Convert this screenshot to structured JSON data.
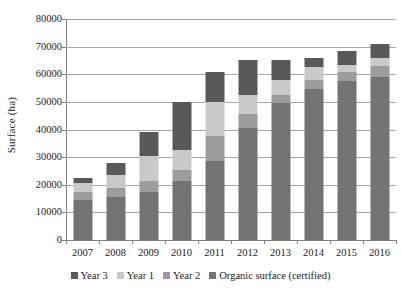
{
  "chart_data": {
    "type": "bar",
    "stacked": true,
    "title": "",
    "xlabel": "",
    "ylabel": "Surface (ha)",
    "ylim": [
      0,
      80000
    ],
    "ytick_labels": [
      "80000",
      "70000",
      "60000",
      "50000",
      "40000",
      "30000",
      "20000",
      "10000",
      "0"
    ],
    "yticks": [
      80000,
      70000,
      60000,
      50000,
      40000,
      30000,
      20000,
      10000,
      0
    ],
    "grid": true,
    "legend_position": "bottom",
    "categories": [
      "2007",
      "2008",
      "2009",
      "2010",
      "2011",
      "2012",
      "2013",
      "2014",
      "2015",
      "2016"
    ],
    "stack_order_bottom_to_top": [
      "Organic surface (certified)",
      "Year 2",
      "Year 1",
      "Year 3"
    ],
    "series": [
      {
        "name": "Organic surface (certified)",
        "color": "#737373",
        "values": [
          14500,
          15500,
          17500,
          21500,
          28500,
          40500,
          49500,
          54500,
          57500,
          59000
        ]
      },
      {
        "name": "Year 2",
        "color": "#9c9c9c",
        "values": [
          3000,
          3500,
          4000,
          4000,
          9000,
          5000,
          3000,
          3500,
          3500,
          4000
        ]
      },
      {
        "name": "Year 1",
        "color": "#c9c9c9",
        "values": [
          3000,
          4500,
          9000,
          7000,
          12500,
          7000,
          5500,
          4500,
          2500,
          3000
        ]
      },
      {
        "name": "Year 3",
        "color": "#595959",
        "values": [
          2000,
          4500,
          8500,
          17500,
          11000,
          12500,
          7000,
          3500,
          5000,
          5000
        ]
      }
    ],
    "totals": [
      22500,
      28000,
      39000,
      50000,
      61000,
      65000,
      65000,
      66000,
      68500,
      71000
    ]
  },
  "legend": {
    "items": [
      {
        "label": "Year 3",
        "color": "#595959"
      },
      {
        "label": "Year 1",
        "color": "#c9c9c9"
      },
      {
        "label": "Year 2",
        "color": "#9c9c9c"
      },
      {
        "label": "Organic surface (certified)",
        "color": "#737373"
      }
    ]
  },
  "axes": {
    "y_title": "Surface (ha)"
  }
}
